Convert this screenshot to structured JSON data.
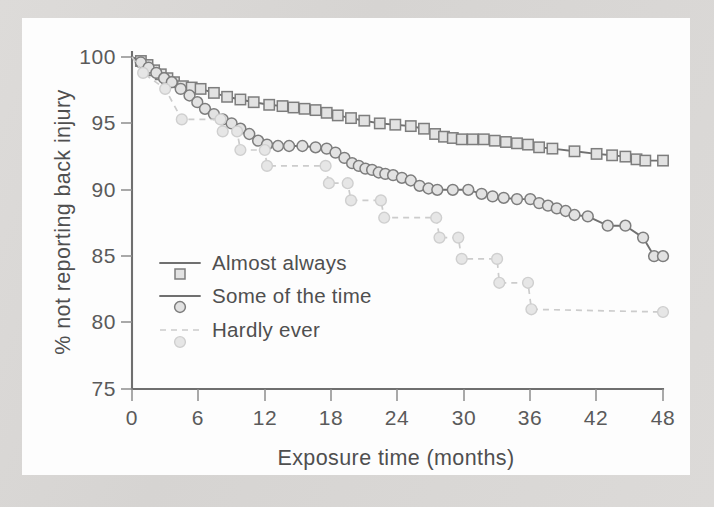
{
  "figure": {
    "background_color": "#d8d8d6",
    "paper_color": "#fdfdfd",
    "line_color": "#707070",
    "faint_color": "#cccccc",
    "marker_fill": "#e2e2e2"
  },
  "axes": {
    "x_label": "Exposure time (months)",
    "y_label": "% not reporting back injury",
    "x_ticks": [
      "0",
      "6",
      "12",
      "18",
      "24",
      "30",
      "36",
      "42",
      "48"
    ],
    "y_ticks": [
      "100",
      "95",
      "90",
      "85",
      "80",
      "75"
    ]
  },
  "legend": {
    "items": [
      {
        "label": "Almost always",
        "marker": "square",
        "style": "solid"
      },
      {
        "label": "Some of the time",
        "marker": "circle",
        "style": "solid"
      },
      {
        "label": "Hardly ever",
        "marker": "circle-faint",
        "style": "dashed"
      }
    ]
  },
  "chart_data": {
    "type": "line",
    "title": "",
    "subtitle": "",
    "xlabel": "Exposure time (months)",
    "ylabel": "% not reporting back injury",
    "xlim": [
      0,
      48
    ],
    "ylim": [
      75,
      100
    ],
    "xticks": [
      0,
      6,
      12,
      18,
      24,
      30,
      36,
      42,
      48
    ],
    "yticks": [
      75,
      80,
      85,
      90,
      95,
      100
    ],
    "grid": false,
    "legend_position": "inside-left",
    "note": "Kaplan-Meier style step/survival curves; y is percent not reporting back injury over exposure months",
    "series": [
      {
        "name": "Almost always",
        "marker": "square",
        "linestyle": "solid",
        "color": "#707070",
        "points": [
          [
            0.0,
            100.0
          ],
          [
            0.8,
            99.7
          ],
          [
            1.4,
            99.4
          ],
          [
            2.0,
            99.0
          ],
          [
            2.6,
            98.7
          ],
          [
            3.2,
            98.4
          ],
          [
            3.8,
            98.1
          ],
          [
            4.6,
            97.8
          ],
          [
            5.4,
            97.7
          ],
          [
            6.2,
            97.6
          ],
          [
            7.4,
            97.3
          ],
          [
            8.6,
            97.0
          ],
          [
            9.8,
            96.8
          ],
          [
            11.0,
            96.6
          ],
          [
            12.4,
            96.4
          ],
          [
            13.6,
            96.3
          ],
          [
            14.6,
            96.2
          ],
          [
            15.6,
            96.1
          ],
          [
            16.6,
            96.0
          ],
          [
            17.6,
            95.8
          ],
          [
            18.6,
            95.6
          ],
          [
            19.8,
            95.4
          ],
          [
            21.0,
            95.2
          ],
          [
            22.4,
            95.0
          ],
          [
            23.8,
            94.9
          ],
          [
            25.2,
            94.8
          ],
          [
            26.4,
            94.6
          ],
          [
            27.4,
            94.2
          ],
          [
            28.2,
            94.0
          ],
          [
            29.0,
            93.9
          ],
          [
            29.8,
            93.8
          ],
          [
            30.8,
            93.8
          ],
          [
            31.8,
            93.8
          ],
          [
            32.8,
            93.7
          ],
          [
            33.8,
            93.6
          ],
          [
            34.8,
            93.5
          ],
          [
            35.8,
            93.4
          ],
          [
            36.8,
            93.2
          ],
          [
            38.0,
            93.1
          ],
          [
            40.0,
            92.9
          ],
          [
            42.0,
            92.7
          ],
          [
            43.4,
            92.6
          ],
          [
            44.6,
            92.5
          ],
          [
            45.6,
            92.3
          ],
          [
            46.4,
            92.2
          ],
          [
            48.0,
            92.2
          ]
        ]
      },
      {
        "name": "Some of the time",
        "marker": "circle",
        "linestyle": "solid",
        "color": "#707070",
        "points": [
          [
            0.0,
            100.0
          ],
          [
            0.8,
            99.6
          ],
          [
            1.5,
            99.2
          ],
          [
            2.2,
            98.8
          ],
          [
            2.9,
            98.4
          ],
          [
            3.6,
            98.1
          ],
          [
            4.4,
            97.6
          ],
          [
            5.2,
            97.1
          ],
          [
            5.9,
            96.6
          ],
          [
            6.6,
            96.1
          ],
          [
            7.4,
            95.7
          ],
          [
            8.2,
            95.3
          ],
          [
            9.0,
            95.0
          ],
          [
            9.8,
            94.6
          ],
          [
            10.6,
            94.2
          ],
          [
            11.4,
            93.7
          ],
          [
            12.2,
            93.4
          ],
          [
            13.2,
            93.3
          ],
          [
            14.2,
            93.3
          ],
          [
            15.4,
            93.3
          ],
          [
            16.6,
            93.2
          ],
          [
            17.6,
            93.1
          ],
          [
            18.4,
            92.8
          ],
          [
            19.2,
            92.4
          ],
          [
            19.9,
            92.0
          ],
          [
            20.5,
            91.8
          ],
          [
            21.1,
            91.6
          ],
          [
            21.7,
            91.5
          ],
          [
            22.3,
            91.3
          ],
          [
            22.9,
            91.2
          ],
          [
            23.6,
            91.1
          ],
          [
            24.4,
            90.9
          ],
          [
            25.2,
            90.7
          ],
          [
            26.0,
            90.3
          ],
          [
            26.8,
            90.1
          ],
          [
            27.6,
            90.0
          ],
          [
            29.0,
            90.0
          ],
          [
            30.4,
            90.0
          ],
          [
            31.6,
            89.7
          ],
          [
            32.6,
            89.5
          ],
          [
            33.6,
            89.4
          ],
          [
            34.8,
            89.3
          ],
          [
            36.0,
            89.3
          ],
          [
            36.8,
            89.0
          ],
          [
            37.6,
            88.8
          ],
          [
            38.4,
            88.6
          ],
          [
            39.2,
            88.4
          ],
          [
            40.0,
            88.1
          ],
          [
            41.2,
            88.0
          ],
          [
            43.0,
            87.3
          ],
          [
            44.6,
            87.3
          ],
          [
            46.2,
            86.4
          ],
          [
            47.2,
            85.0
          ],
          [
            48.0,
            85.0
          ]
        ]
      },
      {
        "name": "Hardly ever",
        "marker": "circle-faint",
        "linestyle": "dashed",
        "color": "#cccccc",
        "points": [
          [
            0.0,
            100.0
          ],
          [
            1.0,
            98.8
          ],
          [
            3.0,
            97.6
          ],
          [
            4.5,
            95.3
          ],
          [
            8.0,
            95.3
          ],
          [
            8.2,
            94.4
          ],
          [
            9.5,
            94.4
          ],
          [
            9.8,
            93.0
          ],
          [
            12.0,
            93.0
          ],
          [
            12.2,
            91.8
          ],
          [
            17.5,
            91.8
          ],
          [
            17.8,
            90.5
          ],
          [
            19.5,
            90.5
          ],
          [
            19.8,
            89.2
          ],
          [
            22.5,
            89.2
          ],
          [
            22.8,
            87.9
          ],
          [
            27.5,
            87.9
          ],
          [
            27.8,
            86.4
          ],
          [
            29.5,
            86.4
          ],
          [
            29.8,
            84.8
          ],
          [
            33.0,
            84.8
          ],
          [
            33.2,
            83.0
          ],
          [
            35.8,
            83.0
          ],
          [
            36.1,
            81.0
          ],
          [
            48.0,
            80.8
          ]
        ]
      }
    ]
  }
}
